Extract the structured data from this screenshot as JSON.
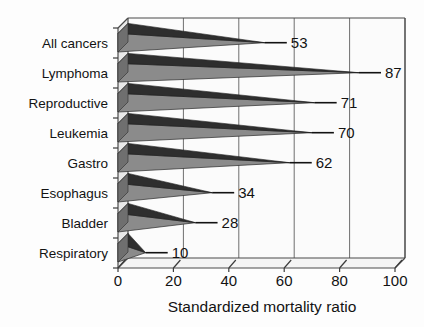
{
  "chart_data": {
    "type": "bar",
    "orientation": "horizontal",
    "style": "3d-cone",
    "title": "",
    "xlabel": "Standardized mortality ratio",
    "ylabel": "",
    "categories": [
      "All cancers",
      "Lymphoma",
      "Reproductive",
      "Leukemia",
      "Gastro",
      "Esophagus",
      "Bladder",
      "Respiratory"
    ],
    "values": [
      53,
      87,
      71,
      70,
      62,
      34,
      28,
      10
    ],
    "value_labels": [
      "53",
      "87",
      "71",
      "70",
      "62",
      "34",
      "28",
      "10"
    ],
    "xticks": [
      0,
      20,
      40,
      60,
      80,
      100
    ],
    "xtick_labels": [
      "0",
      "20",
      "40",
      "60",
      "80",
      "100"
    ],
    "xlim": [
      0,
      100
    ],
    "grid": "vertical",
    "legend": "none",
    "colors": {
      "bar_body": "#8b8b8b",
      "bar_top_edge": "#2e2e2e",
      "background": "#fdfdfd",
      "wall": "#e9e9e9",
      "gridline": "#6e6e6e",
      "text": "#131313"
    }
  },
  "axis": {
    "x_title": "Standardized mortality ratio"
  }
}
